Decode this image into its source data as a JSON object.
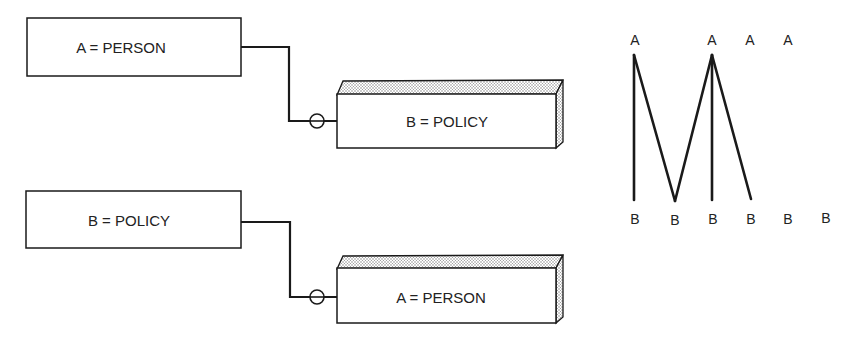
{
  "diagram": {
    "top": {
      "source": {
        "label": "A = PERSON"
      },
      "target": {
        "label": "B = POLICY"
      }
    },
    "bottom": {
      "source": {
        "label": "B = POLICY"
      },
      "target": {
        "label": "A = PERSON"
      }
    },
    "mapping": {
      "a_nodes": [
        "A",
        "A",
        "A",
        "A"
      ],
      "b_nodes": [
        "B",
        "B",
        "B",
        "B",
        "B",
        "B"
      ],
      "links": [
        {
          "from_a": 0,
          "to_b": 0
        },
        {
          "from_a": 0,
          "to_b": 1
        },
        {
          "from_a": 1,
          "to_b": 1
        },
        {
          "from_a": 1,
          "to_b": 2
        },
        {
          "from_a": 1,
          "to_b": 3
        }
      ]
    }
  },
  "colors": {
    "line": "#1a1a1a",
    "stipple": "#9a9a9a",
    "background": "#ffffff"
  }
}
